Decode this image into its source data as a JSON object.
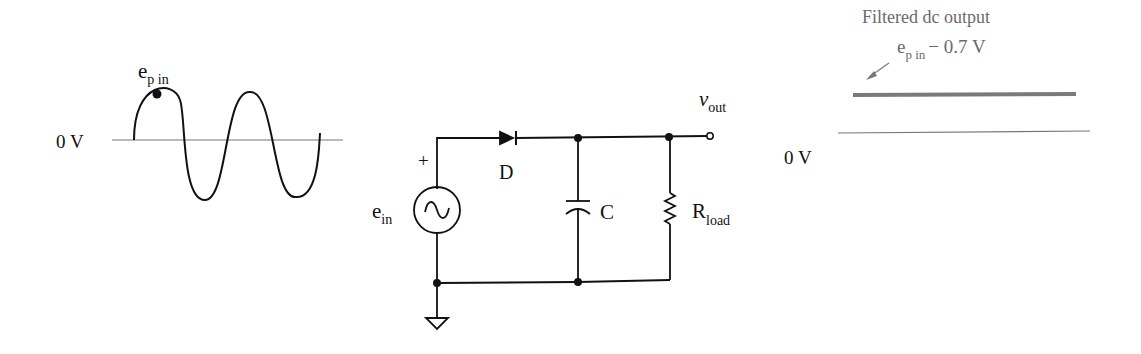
{
  "input_waveform": {
    "peak_label": "e",
    "peak_label_sub": "p in",
    "zero_label": "0 V"
  },
  "circuit": {
    "source_label": "e",
    "source_label_sub": "in",
    "source_polarity": "+",
    "diode_label": "D",
    "capacitor_label": "C",
    "resistor_label": "R",
    "resistor_label_sub": "load",
    "output_label": "v",
    "output_label_sub": "out"
  },
  "output_waveform": {
    "title": "Filtered dc output",
    "level_label": "e",
    "level_label_sub": "p in",
    "level_label_suffix": "− 0.7 V",
    "zero_label": "0 V",
    "dc_line_color": "#7a7a7a"
  }
}
